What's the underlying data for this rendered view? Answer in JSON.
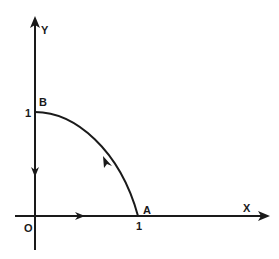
{
  "diagram": {
    "type": "path-diagram",
    "axes": {
      "x_label": "X",
      "y_label": "Y",
      "origin_label": "O"
    },
    "points": {
      "A": {
        "label": "A",
        "coord": [
          1,
          0
        ],
        "tick_label": "1"
      },
      "B": {
        "label": "B",
        "coord": [
          0,
          1
        ],
        "tick_label": "1"
      }
    },
    "path": [
      {
        "from": "O",
        "to": "A",
        "shape": "straight",
        "direction": "along +x"
      },
      {
        "from": "A",
        "to": "B",
        "shape": "curve",
        "direction": "counterclockwise arc"
      },
      {
        "from": "B",
        "to": "O",
        "shape": "straight",
        "direction": "along -y"
      }
    ],
    "colors": {
      "stroke": "#1a1a1a",
      "background": "#ffffff"
    }
  }
}
